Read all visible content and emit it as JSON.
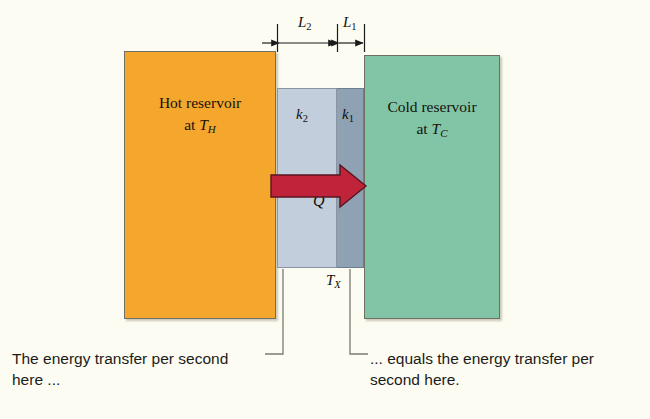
{
  "figure": {
    "background_color": "#fdfcf2"
  },
  "blocks": {
    "hot_reservoir": {
      "line1": "Hot reservoir",
      "line2_prefix": "at ",
      "line2_symbol": "T",
      "line2_subscript": "H",
      "color": "#f4a72c"
    },
    "cold_reservoir": {
      "line1": "Cold reservoir",
      "line2_prefix": "at ",
      "line2_symbol": "T",
      "line2_subscript": "C",
      "color": "#82c4a6"
    },
    "slab_k2": {
      "symbol": "k",
      "subscript": "2",
      "color": "#c2cedb"
    },
    "slab_k1": {
      "symbol": "k",
      "subscript": "1",
      "color": "#8fa2b4"
    }
  },
  "annotations": {
    "heat_flow_symbol": "Q",
    "heat_flow_arrow_color": "#c0243a",
    "interface_symbol": "T",
    "interface_subscript": "X",
    "dimension_l2_symbol": "L",
    "dimension_l2_subscript": "2",
    "dimension_l1_symbol": "L",
    "dimension_l1_subscript": "1"
  },
  "captions": {
    "left": "The energy transfer per second here ...",
    "right": "... equals the energy transfer per second here."
  }
}
